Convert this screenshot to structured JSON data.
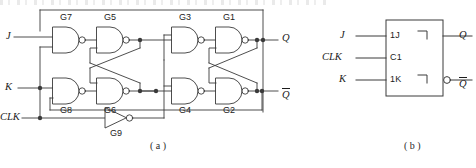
{
  "figure": {
    "title_partial": "",
    "captions": {
      "a": "( a )",
      "b": "( b )"
    }
  },
  "circuit_a": {
    "name": "master-slave-jk-flip-flop-gate-level",
    "inputs": [
      {
        "id": "J",
        "label": "J"
      },
      {
        "id": "K",
        "label": "K"
      },
      {
        "id": "CLK",
        "label": "CLK"
      }
    ],
    "outputs": [
      {
        "id": "Q",
        "label": "Q"
      },
      {
        "id": "Qbar",
        "label": "Q",
        "overline": true
      }
    ],
    "gates": [
      {
        "id": "G1",
        "label": "G1",
        "type": "nand"
      },
      {
        "id": "G2",
        "label": "G2",
        "type": "nand"
      },
      {
        "id": "G3",
        "label": "G3",
        "type": "nand"
      },
      {
        "id": "G4",
        "label": "G4",
        "type": "nand"
      },
      {
        "id": "G5",
        "label": "G5",
        "type": "nand"
      },
      {
        "id": "G6",
        "label": "G6",
        "type": "nand"
      },
      {
        "id": "G7",
        "label": "G7",
        "type": "nand"
      },
      {
        "id": "G8",
        "label": "G8",
        "type": "nand"
      },
      {
        "id": "G9",
        "label": "G9",
        "type": "inverter"
      }
    ]
  },
  "symbol_b": {
    "name": "jk-flip-flop-block-symbol",
    "pins": [
      {
        "id": "1J",
        "label": "1J",
        "signal": "J"
      },
      {
        "id": "C1",
        "label": "C1",
        "signal": "CLK"
      },
      {
        "id": "1K",
        "label": "1K",
        "signal": "K"
      }
    ],
    "input_signals": [
      {
        "id": "J",
        "label": "J"
      },
      {
        "id": "CLK",
        "label": "CLK"
      },
      {
        "id": "K",
        "label": "K"
      }
    ],
    "outputs": [
      {
        "id": "Q",
        "label": "Q",
        "inverted": false
      },
      {
        "id": "Qbar",
        "label": "Q",
        "overline": true,
        "inverted": true
      }
    ],
    "postponed_output_marks": 2
  },
  "colors": {
    "line": "#3a3a3a",
    "text": "#1c1c1c",
    "background": "#ffffff"
  }
}
